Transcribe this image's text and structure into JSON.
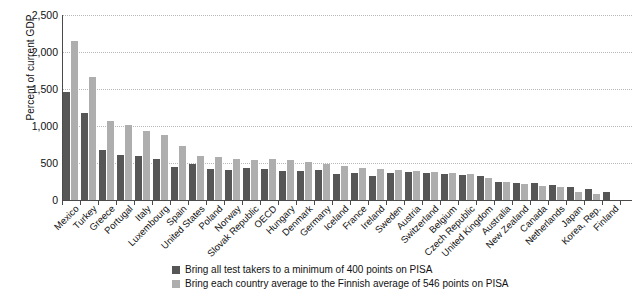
{
  "chart_data": {
    "type": "bar",
    "title": "",
    "xlabel": "",
    "ylabel": "Percent of current GDP",
    "ylim": [
      0,
      2500
    ],
    "yticks": [
      0,
      500,
      1000,
      1500,
      2000,
      2500
    ],
    "ytick_labels": [
      "0",
      "500",
      "1,000",
      "1,500",
      "2,000",
      "2,500"
    ],
    "grid": true,
    "legend_position": "bottom",
    "categories": [
      "Mexico",
      "Turkey",
      "Greece",
      "Portugal",
      "Italy",
      "Luxembourg",
      "Spain",
      "United States",
      "Poland",
      "Norway",
      "Slovak Republic",
      "OECD",
      "Hungary",
      "Denmark",
      "Germany",
      "Iceland",
      "France",
      "Ireland",
      "Sweden",
      "Austria",
      "Switzerland",
      "Belgium",
      "Czech Republic",
      "United Kingdom",
      "Australia",
      "New Zealand",
      "Canada",
      "Netherlands",
      "Japan",
      "Korea, Rep.",
      "Finland"
    ],
    "series": [
      {
        "name": "Bring all test takers to a minimum of 400 points on PISA",
        "color": "#565656",
        "values": [
          1455,
          1180,
          680,
          610,
          590,
          560,
          450,
          480,
          425,
          410,
          435,
          415,
          390,
          395,
          410,
          345,
          360,
          330,
          370,
          385,
          360,
          350,
          340,
          320,
          250,
          235,
          230,
          205,
          175,
          155,
          105
        ]
      },
      {
        "name": "Bring each country average to the Finnish average of 546 points on PISA",
        "color": "#aeaeae",
        "values": [
          2155,
          1665,
          1070,
          1015,
          930,
          880,
          725,
          600,
          580,
          560,
          545,
          555,
          540,
          520,
          490,
          460,
          430,
          415,
          400,
          395,
          380,
          365,
          345,
          300,
          245,
          215,
          190,
          175,
          115,
          80,
          0
        ]
      }
    ]
  },
  "legend": {
    "items": [
      {
        "swatch": "dark",
        "label": "Bring all test takers to a minimum of 400 points on PISA"
      },
      {
        "swatch": "light",
        "label": "Bring each country average to the Finnish average of 546 points on PISA"
      }
    ]
  }
}
